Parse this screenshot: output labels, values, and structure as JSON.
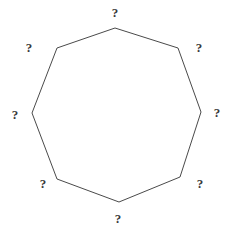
{
  "figure": {
    "name": "octagon-with-unknown-angles",
    "shape_type": "polygon",
    "sides": 8,
    "shape_name": "octagon",
    "background_color": "#ffffff",
    "stroke_color": "#4a4a4a",
    "stroke_width": 1,
    "fill_color": "none",
    "label_color": "#3a3a3a",
    "canvas": {
      "width": 229,
      "height": 234
    },
    "vertices": [
      {
        "id": "top",
        "x": 115,
        "y": 28
      },
      {
        "id": "upper-right",
        "x": 178,
        "y": 48
      },
      {
        "id": "right",
        "x": 201,
        "y": 112
      },
      {
        "id": "lower-right",
        "x": 180,
        "y": 177
      },
      {
        "id": "bottom",
        "x": 119,
        "y": 202
      },
      {
        "id": "lower-left",
        "x": 57,
        "y": 179
      },
      {
        "id": "left",
        "x": 32,
        "y": 113
      },
      {
        "id": "upper-left",
        "x": 57,
        "y": 48
      }
    ],
    "labels": [
      {
        "id": "label-top",
        "text": "?",
        "x": 115,
        "y": 12
      },
      {
        "id": "label-upper-right",
        "text": "?",
        "x": 199,
        "y": 47
      },
      {
        "id": "label-right",
        "text": "?",
        "x": 217,
        "y": 112
      },
      {
        "id": "label-lower-right",
        "text": "?",
        "x": 200,
        "y": 183
      },
      {
        "id": "label-bottom",
        "text": "?",
        "x": 118,
        "y": 218
      },
      {
        "id": "label-lower-left",
        "text": "?",
        "x": 43,
        "y": 183
      },
      {
        "id": "label-left",
        "text": "?",
        "x": 15,
        "y": 114
      },
      {
        "id": "label-upper-left",
        "text": "?",
        "x": 29,
        "y": 47
      }
    ]
  }
}
